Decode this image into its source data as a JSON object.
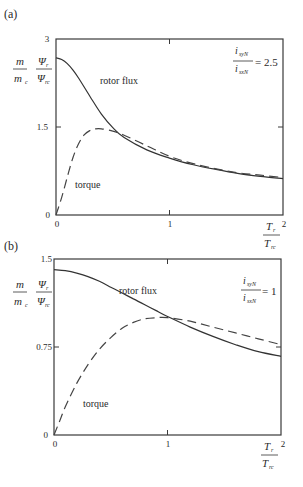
{
  "chart_data": [
    {
      "panel": "(a)",
      "type": "line",
      "title": "",
      "xlabel": "T_r / T_rc",
      "ylabel": "m / m_c , Ψ_r / Ψ_rc",
      "xlim": [
        0,
        2
      ],
      "ylim": [
        0,
        3
      ],
      "xticks": [
        "0",
        "1",
        "2"
      ],
      "yticks": [
        "0",
        "1.5",
        "3"
      ],
      "grid": false,
      "annotation": "i_syN / i_sxN = 2.5",
      "annotation_lhs": "i_syN",
      "annotation_den": "i_sxN",
      "annotation_rhs": "= 2.5",
      "series": [
        {
          "name": "rotor flux",
          "style": "solid",
          "x": [
            0,
            0.05,
            0.1,
            0.15,
            0.2,
            0.3,
            0.4,
            0.5,
            0.6,
            0.8,
            1.0,
            1.2,
            1.4,
            1.6,
            1.8,
            2.0
          ],
          "y": [
            2.68,
            2.65,
            2.58,
            2.47,
            2.33,
            2.02,
            1.72,
            1.49,
            1.32,
            1.11,
            0.97,
            0.86,
            0.78,
            0.71,
            0.66,
            0.62
          ]
        },
        {
          "name": "torque",
          "style": "dashed",
          "x": [
            0,
            0.05,
            0.1,
            0.15,
            0.2,
            0.25,
            0.3,
            0.35,
            0.4,
            0.5,
            0.6,
            0.8,
            1.0,
            1.2,
            1.4,
            1.6,
            1.8,
            2.0
          ],
          "y": [
            0,
            0.3,
            0.65,
            0.98,
            1.22,
            1.37,
            1.44,
            1.47,
            1.47,
            1.43,
            1.36,
            1.18,
            1.0,
            0.88,
            0.79,
            0.72,
            0.68,
            0.64
          ]
        }
      ]
    },
    {
      "panel": "(b)",
      "type": "line",
      "title": "",
      "xlabel": "T_r / T_rc",
      "ylabel": "m / m_c , Ψ_r / Ψ_rc",
      "xlim": [
        0,
        2
      ],
      "ylim": [
        0,
        1.5
      ],
      "xticks": [
        "0",
        "1",
        "2"
      ],
      "yticks": [
        "0",
        "0.75",
        "1.5"
      ],
      "grid": false,
      "annotation": "i_syN / i_sxN = 1",
      "annotation_lhs": "i_syN",
      "annotation_den": "i_sxN",
      "annotation_rhs": "= 1",
      "series": [
        {
          "name": "rotor flux",
          "style": "solid",
          "x": [
            0,
            0.1,
            0.2,
            0.3,
            0.4,
            0.5,
            0.6,
            0.7,
            0.8,
            0.9,
            1.0,
            1.2,
            1.4,
            1.6,
            1.8,
            2.0
          ],
          "y": [
            1.41,
            1.4,
            1.38,
            1.35,
            1.31,
            1.26,
            1.21,
            1.16,
            1.11,
            1.06,
            1.01,
            0.92,
            0.84,
            0.77,
            0.71,
            0.67
          ]
        },
        {
          "name": "torque",
          "style": "dashed",
          "x": [
            0,
            0.05,
            0.1,
            0.2,
            0.3,
            0.4,
            0.5,
            0.6,
            0.7,
            0.8,
            0.9,
            1.0,
            1.2,
            1.4,
            1.6,
            1.8,
            2.0
          ],
          "y": [
            0,
            0.12,
            0.24,
            0.44,
            0.6,
            0.73,
            0.83,
            0.91,
            0.96,
            0.99,
            1.0,
            1.0,
            0.97,
            0.92,
            0.87,
            0.82,
            0.77
          ]
        }
      ]
    }
  ],
  "labels": {
    "panel_a": "(a)",
    "panel_b": "(b)",
    "y_m": "m",
    "y_mc": "m",
    "y_mc_sub": "c",
    "y_psi": "Ψ",
    "y_psi_sub": "r",
    "y_psirc": "Ψ",
    "y_psirc_sub": "rc",
    "x_T": "T",
    "x_T_sub": "r",
    "x_Trc": "T",
    "x_Trc_sub": "rc",
    "rotor_flux": "rotor flux",
    "torque": "torque",
    "i": "i",
    "isyN_sub": "syN",
    "isxN_sub": "sxN",
    "a_rhs": "= 2.5",
    "b_rhs": "= 1",
    "tick_0": "0",
    "tick_1": "1",
    "tick_2": "2",
    "a_ytick_mid": "1.5",
    "a_ytick_top": "3",
    "b_ytick_mid": "0.75",
    "b_ytick_top": "1.5"
  }
}
